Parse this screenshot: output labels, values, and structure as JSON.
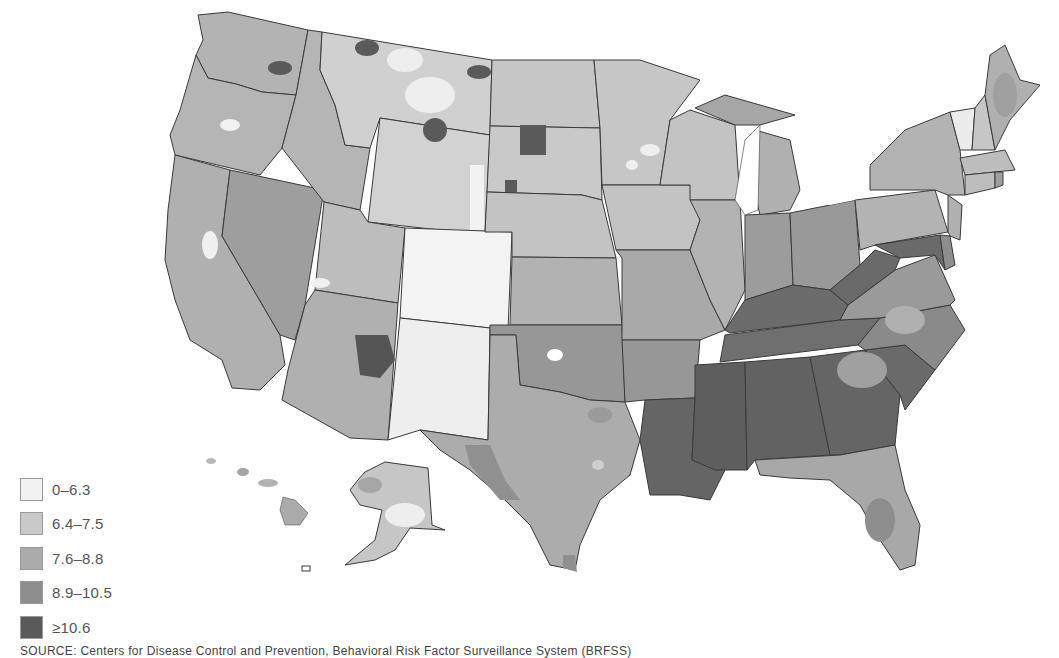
{
  "map": {
    "title": "",
    "type": "choropleth",
    "region": "United States (counties)",
    "insets": [
      "Alaska",
      "Hawaii"
    ]
  },
  "legend": {
    "items": [
      {
        "label": "0–6.3",
        "color": "#f2f2f2"
      },
      {
        "label": "6.4–7.5",
        "color": "#c9c9c9"
      },
      {
        "label": "7.6–8.8",
        "color": "#ababab"
      },
      {
        "label": "8.9–10.5",
        "color": "#8e8e8e"
      },
      {
        "label": "≥10.6",
        "color": "#5a5a5a"
      }
    ]
  },
  "source": "SOURCE: Centers for Disease Control and Prevention, Behavioral Risk Factor Surveillance System (BRFSS)",
  "state_dominant_class": {
    "WA": "7.6–8.8",
    "OR": "7.6–8.8",
    "CA": "7.6–8.8",
    "NV": "8.9–10.5",
    "ID": "7.6–8.8",
    "MT": "6.4–7.5",
    "WY": "6.4–7.5",
    "UT": "6.4–7.5",
    "AZ": "7.6–8.8",
    "CO": "0–6.3",
    "NM": "0–6.3",
    "ND": "6.4–7.5",
    "SD": "6.4–7.5",
    "NE": "6.4–7.5",
    "KS": "7.6–8.8",
    "OK": "8.9–10.5",
    "TX": "7.6–8.8",
    "MN": "6.4–7.5",
    "IA": "6.4–7.5",
    "MO": "7.6–8.8",
    "AR": "8.9–10.5",
    "LA": "≥10.6",
    "WI": "6.4–7.5",
    "IL": "7.6–8.8",
    "MI": "7.6–8.8",
    "IN": "8.9–10.5",
    "OH": "8.9–10.5",
    "KY": "≥10.6",
    "TN": "≥10.6",
    "MS": "≥10.6",
    "AL": "≥10.6",
    "GA": "≥10.6",
    "FL": "7.6–8.8",
    "SC": "≥10.6",
    "NC": "8.9–10.5",
    "VA": "8.9–10.5",
    "WV": "≥10.6",
    "PA": "7.6–8.8",
    "NY": "7.6–8.8",
    "VT": "0–6.3",
    "NH": "6.4–7.5",
    "ME": "7.6–8.8",
    "MA": "6.4–7.5",
    "CT": "6.4–7.5",
    "NJ": "7.6–8.8",
    "DE": "8.9–10.5",
    "MD": "≥10.6",
    "AK": "6.4–7.5",
    "HI": "7.6–8.8"
  }
}
